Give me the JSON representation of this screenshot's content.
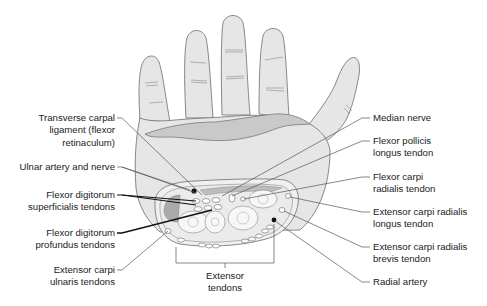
{
  "diagram": {
    "colors": {
      "skin_fill": "#e6e6e6",
      "outline": "#7a7a7a",
      "ligament_fill": "#c9c9c9",
      "dark_structure": "#111111",
      "section_fill": "#ededed",
      "leader_line": "#555555",
      "text": "#222222"
    }
  },
  "labels": {
    "left": [
      {
        "id": "transverse-carpal-ligament",
        "lines": [
          "Transverse carpal",
          "ligament (flexor",
          "retinaculum)"
        ]
      },
      {
        "id": "ulnar-artery-nerve",
        "lines": [
          "Ulnar artery and nerve"
        ]
      },
      {
        "id": "flexor-digitorum-superficialis",
        "lines": [
          "Flexor digitorum",
          "superficialis tendons"
        ]
      },
      {
        "id": "flexor-digitorum-profundus",
        "lines": [
          "Flexor digitorum",
          "profundus tendons"
        ]
      },
      {
        "id": "extensor-carpi-ulnaris",
        "lines": [
          "Extensor carpi",
          "ulnaris tendons"
        ]
      }
    ],
    "right": [
      {
        "id": "median-nerve",
        "lines": [
          "Median nerve"
        ]
      },
      {
        "id": "flexor-pollicis-longus",
        "lines": [
          "Flexor pollicis",
          "longus tendon"
        ]
      },
      {
        "id": "flexor-carpi-radialis",
        "lines": [
          "Flexor carpi",
          "radialis tendon"
        ]
      },
      {
        "id": "extensor-carpi-radialis-longus",
        "lines": [
          "Extensor carpi radialis",
          "longus tendon"
        ]
      },
      {
        "id": "extensor-carpi-radialis-brevis",
        "lines": [
          "Extensor carpi radialis",
          "brevis tendon"
        ]
      },
      {
        "id": "radial-artery",
        "lines": [
          "Radial artery"
        ]
      }
    ],
    "bottom": [
      {
        "id": "extensor-tendons",
        "lines": [
          "Extensor",
          "tendons"
        ]
      }
    ]
  }
}
